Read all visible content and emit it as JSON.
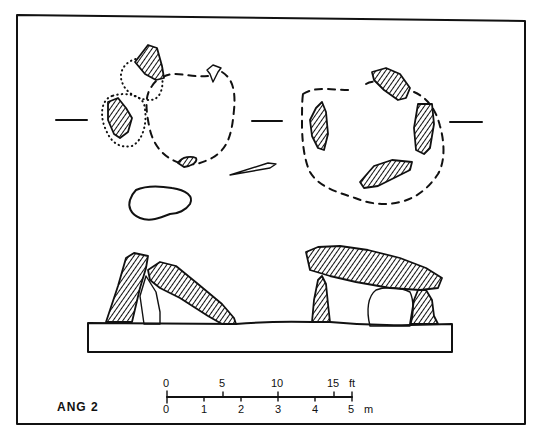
{
  "figure": {
    "label": "ANG 2",
    "background": "#ffffff",
    "ink_color": "#111111"
  },
  "plan_views": [
    {
      "name": "left-tomb-plan",
      "stones": 4,
      "outline": "dashed",
      "notes": "dotted pits around two stones"
    },
    {
      "name": "right-tomb-plan",
      "stones": 4,
      "outline": "dashed"
    }
  ],
  "section_markers": [
    "left",
    "center",
    "right"
  ],
  "north_arrow": {
    "present": true
  },
  "elevations": [
    {
      "name": "left-tomb-elevation",
      "description": "leaning uprights with collapsed capstone"
    },
    {
      "name": "right-tomb-elevation",
      "description": "capstone on uprights"
    }
  ],
  "scale_bar": {
    "feet_unit": "ft",
    "metre_unit": "m",
    "feet_ticks": [
      "0",
      "5",
      "10",
      "15"
    ],
    "metre_ticks": [
      "0",
      "1",
      "2",
      "3",
      "4",
      "5"
    ]
  }
}
